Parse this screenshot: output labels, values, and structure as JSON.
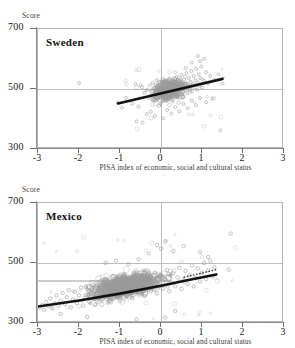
{
  "figure": {
    "score_axis_label": "Score",
    "x_caption": "PISA index of economic, social and cultural status",
    "y_ticks": [
      "700",
      "500",
      "300"
    ],
    "x_ticks": [
      "-3",
      "-2",
      "-1",
      "0",
      "1",
      "2",
      "3"
    ],
    "colors": {
      "marker": "#9a9a9a",
      "regression": "#111111",
      "reference": "#8f8f8f",
      "grid": "#bdbdbd",
      "frame": "#b5b5b5",
      "text": "#1a1a1a"
    }
  },
  "panels": [
    {
      "id": "sweden",
      "title": "Sweden"
    },
    {
      "id": "mexico",
      "title": "Mexico"
    }
  ],
  "chart_data": [
    {
      "type": "scatter",
      "title": "Sweden",
      "xlabel": "PISA index of economic, social and cultural status",
      "ylabel": "Score",
      "xlim": [
        -3,
        3
      ],
      "ylim": [
        300,
        700
      ],
      "xticks": [
        -3,
        -2,
        -1,
        0,
        1,
        2,
        3
      ],
      "yticks": [
        300,
        500,
        700
      ],
      "grid": true,
      "gridlines": {
        "horizontal": [
          500
        ],
        "vertical": [
          0
        ]
      },
      "legend": "none",
      "series": [
        {
          "name": "students",
          "marker": "open-circle",
          "color": "#9a9a9a",
          "n_points": 210,
          "x_range": [
            -1.1,
            1.6
          ],
          "y_range": [
            360,
            625
          ],
          "x_mean": 0.25,
          "y_mean": 497,
          "points": [
            [
              -0.62,
              516
            ],
            [
              -0.46,
              505
            ],
            [
              -0.41,
              487
            ],
            [
              -0.34,
              498
            ],
            [
              -0.3,
              470
            ],
            [
              -0.27,
              512
            ],
            [
              -0.22,
              492
            ],
            [
              -0.2,
              521
            ],
            [
              -0.18,
              466
            ],
            [
              -0.15,
              503
            ],
            [
              -0.12,
              487
            ],
            [
              -0.1,
              530
            ],
            [
              -0.08,
              474
            ],
            [
              -0.06,
              500
            ],
            [
              -0.04,
              513
            ],
            [
              -0.02,
              481
            ],
            [
              0.0,
              497
            ],
            [
              0.01,
              520
            ],
            [
              0.03,
              460
            ],
            [
              0.05,
              505
            ],
            [
              0.06,
              489
            ],
            [
              0.08,
              526
            ],
            [
              0.1,
              471
            ],
            [
              0.12,
              499
            ],
            [
              0.14,
              515
            ],
            [
              0.16,
              483
            ],
            [
              0.18,
              507
            ],
            [
              0.2,
              534
            ],
            [
              0.22,
              478
            ],
            [
              0.24,
              501
            ],
            [
              0.26,
              519
            ],
            [
              0.28,
              464
            ],
            [
              0.3,
              495
            ],
            [
              0.32,
              523
            ],
            [
              0.34,
              486
            ],
            [
              0.36,
              509
            ],
            [
              0.38,
              540
            ],
            [
              0.4,
              472
            ],
            [
              0.42,
              503
            ],
            [
              0.44,
              528
            ],
            [
              0.46,
              490
            ],
            [
              0.48,
              512
            ],
            [
              0.5,
              547
            ],
            [
              0.52,
              481
            ],
            [
              0.54,
              506
            ],
            [
              0.56,
              532
            ],
            [
              0.58,
              494
            ],
            [
              0.6,
              518
            ],
            [
              0.62,
              553
            ],
            [
              0.64,
              487
            ],
            [
              0.66,
              510
            ],
            [
              0.68,
              537
            ],
            [
              0.7,
              499
            ],
            [
              0.72,
              524
            ],
            [
              0.74,
              560
            ],
            [
              0.76,
              492
            ],
            [
              0.78,
              516
            ],
            [
              0.8,
              543
            ],
            [
              0.82,
              505
            ],
            [
              0.84,
              529
            ],
            [
              0.86,
              567
            ],
            [
              0.88,
              498
            ],
            [
              0.9,
              522
            ],
            [
              0.92,
              549
            ],
            [
              0.94,
              511
            ],
            [
              0.96,
              536
            ],
            [
              0.98,
              575
            ],
            [
              1.0,
              504
            ],
            [
              1.05,
              528
            ],
            [
              1.1,
              556
            ],
            [
              1.15,
              519
            ],
            [
              1.2,
              543
            ],
            [
              1.3,
              530
            ],
            [
              1.4,
              549
            ],
            [
              1.5,
              518
            ],
            [
              -0.85,
              470
            ],
            [
              -0.7,
              452
            ],
            [
              -0.55,
              441
            ],
            [
              -0.95,
              438
            ],
            [
              -1.05,
              455
            ],
            [
              -2.0,
              520
            ],
            [
              -0.5,
              512
            ],
            [
              -0.6,
              392
            ],
            [
              -0.45,
              388
            ],
            [
              -0.35,
              417
            ],
            [
              -0.25,
              424
            ],
            [
              -0.15,
              410
            ],
            [
              0.05,
              402
            ],
            [
              0.15,
              430
            ],
            [
              0.25,
              418
            ],
            [
              0.35,
              440
            ],
            [
              0.45,
              426
            ],
            [
              0.55,
              450
            ],
            [
              0.65,
              436
            ],
            [
              0.75,
              462
            ],
            [
              0.85,
              446
            ],
            [
              0.95,
              470
            ],
            [
              1.1,
              456
            ],
            [
              1.25,
              468
            ],
            [
              1.45,
              362
            ],
            [
              0.9,
              610
            ],
            [
              0.95,
              593
            ],
            [
              0.75,
              588
            ],
            [
              0.6,
              570
            ],
            [
              1.05,
              600
            ]
          ]
        }
      ],
      "trend_lines": [
        {
          "name": "within-school-regression",
          "style": "thick-solid",
          "color": "#111111",
          "x": [
            -1.05,
            1.5
          ],
          "y": [
            452,
            533
          ]
        },
        {
          "name": "between-school-reference",
          "style": "thin-solid",
          "color": "#8f8f8f",
          "x": [
            -0.3,
            1.55
          ],
          "y": [
            479,
            539
          ]
        }
      ]
    },
    {
      "type": "scatter",
      "title": "Mexico",
      "xlabel": "PISA index of economic, social and cultural status",
      "ylabel": "Score",
      "xlim": [
        -3,
        3
      ],
      "ylim": [
        300,
        700
      ],
      "xticks": [
        -3,
        -2,
        -1,
        0,
        1,
        2,
        3
      ],
      "yticks": [
        300,
        500,
        700
      ],
      "grid": true,
      "gridlines": {
        "horizontal": [
          500
        ],
        "vertical": [
          0
        ]
      },
      "legend": "none",
      "series": [
        {
          "name": "students",
          "marker": "open-circle",
          "color": "#9a9a9a",
          "n_points": 900,
          "x_range": [
            -3.0,
            1.35
          ],
          "y_range": [
            305,
            600
          ],
          "x_mean": -0.9,
          "y_mean": 420,
          "points": [
            [
              -2.95,
              352
            ],
            [
              -2.9,
              361
            ],
            [
              -2.85,
              344
            ],
            [
              -2.8,
              370
            ],
            [
              -2.75,
              356
            ],
            [
              -2.7,
              382
            ],
            [
              -2.65,
              349
            ],
            [
              -2.6,
              366
            ],
            [
              -2.55,
              392
            ],
            [
              -2.5,
              358
            ],
            [
              -2.45,
              374
            ],
            [
              -2.4,
              400
            ],
            [
              -2.35,
              363
            ],
            [
              -2.3,
              386
            ],
            [
              -2.25,
              410
            ],
            [
              -2.2,
              352
            ],
            [
              -2.15,
              378
            ],
            [
              -2.1,
              404
            ],
            [
              -2.05,
              366
            ],
            [
              -2.0,
              392
            ],
            [
              -1.95,
              418
            ],
            [
              -1.9,
              358
            ],
            [
              -1.85,
              384
            ],
            [
              -1.8,
              412
            ],
            [
              -1.75,
              370
            ],
            [
              -1.7,
              398
            ],
            [
              -1.65,
              428
            ],
            [
              -1.6,
              362
            ],
            [
              -1.55,
              390
            ],
            [
              -1.5,
              420
            ],
            [
              -1.45,
              376
            ],
            [
              -1.4,
              404
            ],
            [
              -1.35,
              436
            ],
            [
              -1.3,
              368
            ],
            [
              -1.25,
              396
            ],
            [
              -1.2,
              426
            ],
            [
              -1.15,
              382
            ],
            [
              -1.1,
              412
            ],
            [
              -1.05,
              444
            ],
            [
              -1.0,
              374
            ],
            [
              -0.95,
              402
            ],
            [
              -0.9,
              434
            ],
            [
              -0.85,
              390
            ],
            [
              -0.8,
              420
            ],
            [
              -0.75,
              452
            ],
            [
              -0.7,
              382
            ],
            [
              -0.65,
              410
            ],
            [
              -0.6,
              442
            ],
            [
              -0.55,
              398
            ],
            [
              -0.5,
              428
            ],
            [
              -0.45,
              460
            ],
            [
              -0.4,
              390
            ],
            [
              -0.35,
              418
            ],
            [
              -0.3,
              450
            ],
            [
              -0.25,
              406
            ],
            [
              -0.2,
              436
            ],
            [
              -0.15,
              468
            ],
            [
              -0.1,
              398
            ],
            [
              -0.05,
              426
            ],
            [
              0.0,
              458
            ],
            [
              0.05,
              414
            ],
            [
              0.1,
              444
            ],
            [
              0.15,
              476
            ],
            [
              0.2,
              406
            ],
            [
              0.25,
              434
            ],
            [
              0.3,
              466
            ],
            [
              0.35,
              422
            ],
            [
              0.4,
              452
            ],
            [
              0.45,
              484
            ],
            [
              0.5,
              414
            ],
            [
              0.55,
              442
            ],
            [
              0.6,
              474
            ],
            [
              0.65,
              430
            ],
            [
              0.7,
              460
            ],
            [
              0.75,
              492
            ],
            [
              0.8,
              422
            ],
            [
              0.85,
              450
            ],
            [
              0.9,
              482
            ],
            [
              0.95,
              438
            ],
            [
              1.0,
              468
            ],
            [
              1.05,
              500
            ],
            [
              1.1,
              446
            ],
            [
              1.15,
              476
            ],
            [
              1.2,
              508
            ],
            [
              1.25,
              455
            ],
            [
              1.3,
              486
            ],
            [
              -0.1,
              560
            ],
            [
              0.0,
              548
            ],
            [
              0.1,
              572
            ],
            [
              -0.3,
              532
            ],
            [
              0.3,
              540
            ],
            [
              0.55,
              556
            ],
            [
              0.95,
              536
            ],
            [
              1.15,
              520
            ],
            [
              1.7,
              598
            ],
            [
              -1.35,
              500
            ],
            [
              -1.1,
              508
            ],
            [
              -0.8,
              496
            ],
            [
              -0.55,
              512
            ],
            [
              1.65,
              478
            ],
            [
              0.35,
              340
            ],
            [
              0.1,
              318
            ],
            [
              -0.6,
              312
            ],
            [
              -1.8,
              320
            ],
            [
              -2.45,
              330
            ]
          ]
        }
      ],
      "trend_lines": [
        {
          "name": "within-school-regression",
          "style": "thick-curve",
          "color": "#111111",
          "x": [
            -3.0,
            -2.0,
            -1.0,
            0.0,
            0.7,
            1.35
          ],
          "y": [
            355,
            375,
            398,
            424,
            444,
            462
          ]
        },
        {
          "name": "upper-dotted-segment",
          "style": "dotted",
          "color": "#333333",
          "x": [
            0.55,
            1.35
          ],
          "y": [
            452,
            478
          ]
        },
        {
          "name": "country-mean-reference",
          "style": "thin-horizontal",
          "color": "#8f8f8f",
          "x": [
            -3.0,
            0.25
          ],
          "y": [
            440,
            440
          ]
        }
      ]
    }
  ]
}
